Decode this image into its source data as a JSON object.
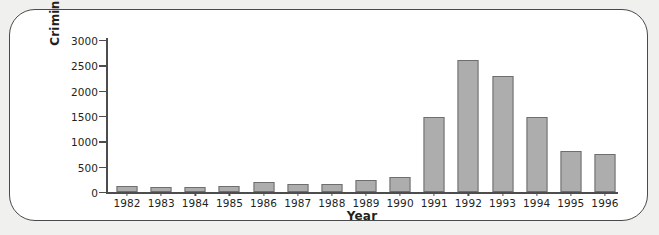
{
  "chart_data": {
    "type": "bar",
    "title": "",
    "xlabel": "Year",
    "ylabel": "Criminal Offenses",
    "categories": [
      "1982",
      "1983",
      "1984",
      "1985",
      "1986",
      "1987",
      "1988",
      "1989",
      "1990",
      "1991",
      "1992",
      "1993",
      "1994",
      "1995",
      "1996"
    ],
    "values": [
      110,
      100,
      105,
      125,
      195,
      160,
      165,
      235,
      300,
      1480,
      2610,
      2290,
      1480,
      810,
      760
    ],
    "ylim": [
      0,
      3000
    ],
    "yticks": [
      0,
      500,
      1000,
      1500,
      2000,
      2500,
      3000
    ],
    "ytick_labels": [
      "0",
      "500",
      "1000",
      "1500",
      "2000",
      "2500",
      "3000"
    ],
    "grid": false,
    "legend": null,
    "series": [
      {
        "name": "Criminal Offenses",
        "values": [
          110,
          100,
          105,
          125,
          195,
          160,
          165,
          235,
          300,
          1480,
          2610,
          2290,
          1480,
          810,
          760
        ]
      }
    ],
    "colors": {
      "bar_fill": "#adadad",
      "bar_edge": "#6e6e6e",
      "axis": "#4d4d4d",
      "text": "#231f20",
      "frame_border": "#4a4a4a",
      "page_background": "#f0f0ee",
      "plot_background": "#ffffff"
    }
  }
}
